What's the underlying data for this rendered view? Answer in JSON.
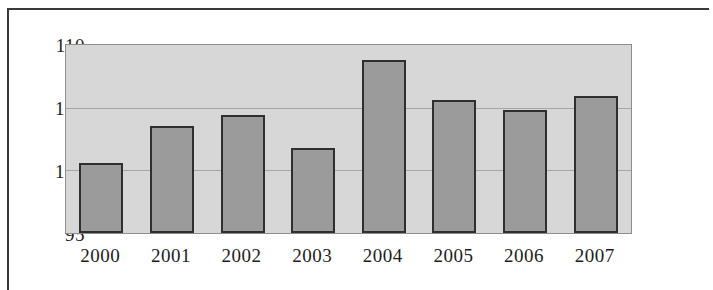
{
  "chart_data": {
    "type": "bar",
    "title": "",
    "subtitle": "",
    "xlabel": "",
    "ylabel": "",
    "categories": [
      "2000",
      "2001",
      "2002",
      "2003",
      "2004",
      "2005",
      "2006",
      "2007"
    ],
    "values": [
      100.6,
      103.5,
      104.4,
      101.8,
      108.8,
      105.6,
      104.8,
      105.9
    ],
    "series": [
      {
        "name": "",
        "values": [
          100.6,
          103.5,
          104.4,
          101.8,
          108.8,
          105.6,
          104.8,
          105.9
        ]
      }
    ],
    "ylim": [
      95,
      110
    ],
    "ytick_labels": [
      "110",
      "105",
      "100",
      "95"
    ],
    "ytick_values": [
      110,
      105,
      100,
      95
    ],
    "xtick_labels": [
      "2000",
      "2001",
      "2002",
      "2003",
      "2004",
      "2005",
      "2006",
      "2007"
    ],
    "grid": true,
    "grid_axis": "y",
    "legend": false,
    "legend_position": "none",
    "annotations": [],
    "colors": {
      "bar_fill": "#9b9b9b",
      "bar_border": "#2f2f2f",
      "plot_background": "#d7d7d7",
      "gridline": "#a6a6a6",
      "axis_border": "#8d8d8d",
      "text": "#1d1d1d",
      "page_background": "#ffffff",
      "frame_border": "#3a3a3a"
    }
  }
}
